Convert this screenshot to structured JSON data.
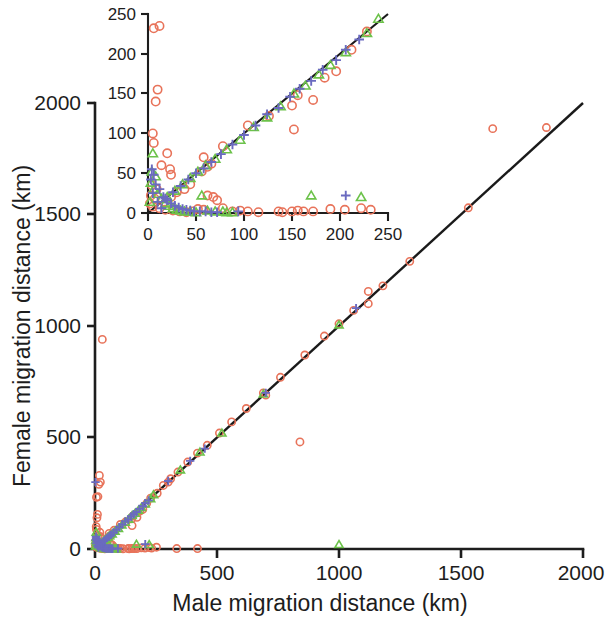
{
  "figure": {
    "kind": "scatter-plot-with-inset",
    "background_color": "#ffffff"
  },
  "colors": {
    "circle": "#e8735a",
    "triangle": "#6cc24a",
    "plus": "#6a6ac0",
    "axis": "#1d1d1d",
    "fit_line": "#1a1a1a"
  },
  "main_axes": {
    "xlabel": "Male migration distance (km)",
    "ylabel": "Female migration distance (km)",
    "xticks": [
      "0",
      "500",
      "1000",
      "1500",
      "2000"
    ],
    "yticks": [
      "0",
      "500",
      "1000",
      "1500",
      "2000"
    ],
    "xlim": [
      0,
      2000
    ],
    "ylim": [
      0,
      2000
    ]
  },
  "inset_axes": {
    "xticks": [
      "0",
      "50",
      "100",
      "150",
      "200",
      "250"
    ],
    "yticks": [
      "0",
      "50",
      "100",
      "150",
      "200",
      "250"
    ],
    "xlim": [
      0,
      250
    ],
    "ylim": [
      0,
      250
    ]
  },
  "chart_data": {
    "type": "scatter",
    "title": "",
    "xlabel": "Male migration distance (km)",
    "ylabel": "Female migration distance (km)",
    "xlim": [
      0,
      2000
    ],
    "ylim": [
      0,
      2000
    ],
    "xticks": [
      0,
      500,
      1000,
      1500,
      2000
    ],
    "yticks": [
      0,
      500,
      1000,
      1500,
      2000
    ],
    "grid": false,
    "legend": "none",
    "reference_line": {
      "description": "identity line y = x",
      "slope": 1,
      "intercept": 0
    },
    "series": [
      {
        "name": "circle",
        "marker": "open-circle",
        "color": "#e8735a",
        "points": [
          [
            30,
            940
          ],
          [
            18,
            330
          ],
          [
            22,
            300
          ],
          [
            16,
            290
          ],
          [
            12,
            235
          ],
          [
            6,
            232
          ],
          [
            10,
            155
          ],
          [
            8,
            140
          ],
          [
            5,
            100
          ],
          [
            6,
            88
          ],
          [
            20,
            75
          ],
          [
            14,
            60
          ],
          [
            23,
            55
          ],
          [
            24,
            48
          ],
          [
            4,
            35
          ],
          [
            9,
            30
          ],
          [
            3,
            22
          ],
          [
            7,
            18
          ],
          [
            2,
            12
          ],
          [
            5,
            8
          ],
          [
            12,
            6
          ],
          [
            18,
            4
          ],
          [
            26,
            3
          ],
          [
            33,
            2
          ],
          [
            40,
            1
          ],
          [
            46,
            2
          ],
          [
            52,
            5
          ],
          [
            58,
            4
          ],
          [
            62,
            22
          ],
          [
            68,
            20
          ],
          [
            72,
            16
          ],
          [
            78,
            6
          ],
          [
            88,
            2
          ],
          [
            96,
            3
          ],
          [
            104,
            2
          ],
          [
            115,
            1
          ],
          [
            136,
            2
          ],
          [
            140,
            1
          ],
          [
            150,
            2
          ],
          [
            156,
            3
          ],
          [
            162,
            2
          ],
          [
            172,
            2
          ],
          [
            232,
            4
          ],
          [
            58,
            70
          ],
          [
            66,
            62
          ],
          [
            78,
            84
          ],
          [
            104,
            110
          ],
          [
            126,
            122
          ],
          [
            150,
            135
          ],
          [
            156,
            148
          ],
          [
            172,
            142
          ],
          [
            184,
            170
          ],
          [
            196,
            178
          ],
          [
            212,
            205
          ],
          [
            228,
            228
          ],
          [
            152,
            105
          ],
          [
            62,
            58
          ],
          [
            56,
            52
          ],
          [
            44,
            36
          ],
          [
            38,
            30
          ],
          [
            30,
            26
          ],
          [
            24,
            20
          ],
          [
            300,
            300
          ],
          [
            335,
            2
          ],
          [
            420,
            2
          ],
          [
            190,
            5
          ],
          [
            205,
            4
          ],
          [
            222,
            6
          ],
          [
            252,
            8
          ],
          [
            255,
            250
          ],
          [
            280,
            285
          ],
          [
            310,
            315
          ],
          [
            340,
            345
          ],
          [
            380,
            390
          ],
          [
            420,
            430
          ],
          [
            460,
            465
          ],
          [
            510,
            520
          ],
          [
            560,
            570
          ],
          [
            620,
            630
          ],
          [
            690,
            700
          ],
          [
            700,
            690
          ],
          [
            760,
            770
          ],
          [
            840,
            480
          ],
          [
            860,
            870
          ],
          [
            940,
            955
          ],
          [
            1000,
            1010
          ],
          [
            1060,
            1070
          ],
          [
            1120,
            1100
          ],
          [
            1180,
            1180
          ],
          [
            1290,
            1290
          ],
          [
            1530,
            1530
          ],
          [
            1630,
            1885
          ],
          [
            1850,
            1890
          ],
          [
            1120,
            1155
          ]
        ]
      },
      {
        "name": "triangle",
        "marker": "open-triangle",
        "color": "#6cc24a",
        "points": [
          [
            5,
            75
          ],
          [
            4,
            52
          ],
          [
            8,
            46
          ],
          [
            3,
            38
          ],
          [
            6,
            30
          ],
          [
            10,
            24
          ],
          [
            14,
            18
          ],
          [
            2,
            14
          ],
          [
            18,
            12
          ],
          [
            22,
            9
          ],
          [
            26,
            6
          ],
          [
            30,
            4
          ],
          [
            34,
            3
          ],
          [
            38,
            2
          ],
          [
            44,
            2
          ],
          [
            50,
            1
          ],
          [
            56,
            22
          ],
          [
            62,
            3
          ],
          [
            70,
            2
          ],
          [
            78,
            2
          ],
          [
            82,
            1
          ],
          [
            88,
            1
          ],
          [
            170,
            22
          ],
          [
            222,
            20
          ],
          [
            20,
            20
          ],
          [
            28,
            28
          ],
          [
            36,
            36
          ],
          [
            44,
            44
          ],
          [
            52,
            52
          ],
          [
            60,
            60
          ],
          [
            70,
            68
          ],
          [
            82,
            80
          ],
          [
            96,
            92
          ],
          [
            110,
            108
          ],
          [
            124,
            120
          ],
          [
            138,
            134
          ],
          [
            152,
            150
          ],
          [
            164,
            160
          ],
          [
            178,
            174
          ],
          [
            190,
            186
          ],
          [
            206,
            202
          ],
          [
            228,
            226
          ],
          [
            240,
            244
          ],
          [
            350,
            355
          ],
          [
            430,
            435
          ],
          [
            520,
            520
          ],
          [
            690,
            695
          ],
          [
            1000,
            1005
          ],
          [
            1000,
            20
          ]
        ]
      },
      {
        "name": "plus",
        "marker": "plus",
        "color": "#6a6ac0",
        "points": [
          [
            2,
            300
          ],
          [
            4,
            55
          ],
          [
            6,
            48
          ],
          [
            3,
            42
          ],
          [
            8,
            36
          ],
          [
            12,
            30
          ],
          [
            5,
            25
          ],
          [
            16,
            20
          ],
          [
            20,
            16
          ],
          [
            10,
            14
          ],
          [
            24,
            12
          ],
          [
            28,
            9
          ],
          [
            32,
            7
          ],
          [
            14,
            6
          ],
          [
            36,
            5
          ],
          [
            40,
            4
          ],
          [
            44,
            3
          ],
          [
            48,
            2
          ],
          [
            54,
            2
          ],
          [
            60,
            2
          ],
          [
            66,
            1
          ],
          [
            72,
            1
          ],
          [
            94,
            2
          ],
          [
            206,
            22
          ],
          [
            18,
            18
          ],
          [
            26,
            26
          ],
          [
            34,
            34
          ],
          [
            42,
            42
          ],
          [
            50,
            50
          ],
          [
            58,
            56
          ],
          [
            66,
            64
          ],
          [
            76,
            74
          ],
          [
            88,
            86
          ],
          [
            100,
            98
          ],
          [
            112,
            110
          ],
          [
            124,
            124
          ],
          [
            136,
            132
          ],
          [
            148,
            146
          ],
          [
            158,
            156
          ],
          [
            170,
            166
          ],
          [
            182,
            180
          ],
          [
            196,
            192
          ],
          [
            206,
            205
          ],
          [
            220,
            218
          ],
          [
            300,
            305
          ],
          [
            390,
            395
          ],
          [
            450,
            450
          ],
          [
            700,
            700
          ],
          [
            1070,
            1080
          ]
        ]
      }
    ]
  }
}
